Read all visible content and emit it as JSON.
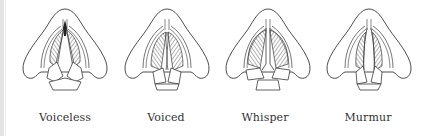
{
  "figure": {
    "panels": [
      {
        "id": "voiceless",
        "label": "Voiceless",
        "center_x": 65,
        "glottis": "open-triangle"
      },
      {
        "id": "voiced",
        "label": "Voiced",
        "center_x": 167,
        "glottis": "closed-vibrating"
      },
      {
        "id": "whisper",
        "label": "Whisper",
        "center_x": 268,
        "glottis": "closed-front-open-back"
      },
      {
        "id": "murmur",
        "label": "Murmur",
        "center_x": 369,
        "glottis": "open-back-chink"
      }
    ],
    "stroke_color": "#3a3a3a",
    "hatch_color": "#555555"
  }
}
